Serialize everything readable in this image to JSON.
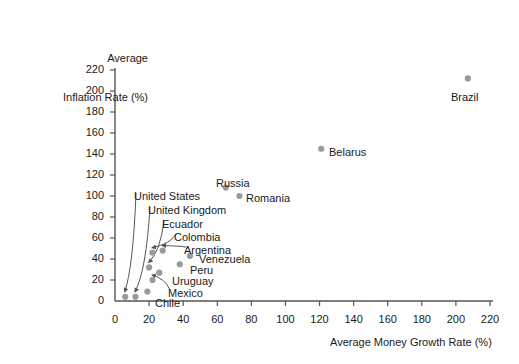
{
  "chart_data": {
    "type": "scatter",
    "title": "",
    "xlabel": "Average Money Growth Rate (%)",
    "ylabel_line1": "Average",
    "ylabel_line2": "Inflation Rate (%)",
    "xlim": [
      0,
      220
    ],
    "ylim": [
      0,
      220
    ],
    "xticks": [
      0,
      20,
      40,
      60,
      80,
      100,
      120,
      140,
      160,
      180,
      200,
      220
    ],
    "yticks": [
      0,
      20,
      40,
      60,
      80,
      100,
      120,
      140,
      160,
      180,
      200,
      220
    ],
    "grid": false,
    "legend": "none",
    "point_color": "#9a9a9a",
    "axis_color": "#555555",
    "text_color": "#1a1a1a",
    "points": [
      {
        "name": "Brazil",
        "x": 207,
        "y": 212,
        "label_dx": -2,
        "label_dy": 11,
        "label_anchor": "middle",
        "leader": false
      },
      {
        "name": "Belarus",
        "x": 121,
        "y": 145,
        "label_dx": 6,
        "label_dy": 4,
        "label_anchor": "start",
        "leader": false
      },
      {
        "name": "Russia",
        "x": 65,
        "y": 108,
        "label_dx": -3,
        "label_dy": -7,
        "label_anchor": "middle",
        "leader": false
      },
      {
        "name": "Romania",
        "x": 73,
        "y": 100,
        "label_dx": 6,
        "label_dy": 4,
        "label_anchor": "start",
        "leader": false
      },
      {
        "name": "Venezuela",
        "x": 44,
        "y": 43,
        "label_dx": 6,
        "label_dy": 4,
        "label_anchor": "start",
        "leader": false
      },
      {
        "name": "Peru",
        "x": 38,
        "y": 35,
        "label_dx": 6,
        "label_dy": 4,
        "label_anchor": "start",
        "leader": false
      },
      {
        "name": "Argentina",
        "x": 28,
        "y": 48,
        "label_dx": 0,
        "label_dy": 0,
        "label_anchor": "start",
        "leader": true
      },
      {
        "name": "Colombia",
        "x": 22,
        "y": 46,
        "label_dx": 0,
        "label_dy": 0,
        "label_anchor": "start",
        "leader": true
      },
      {
        "name": "Ecuador",
        "x": 20,
        "y": 32,
        "label_dx": 0,
        "label_dy": 0,
        "label_anchor": "start",
        "leader": true
      },
      {
        "name": "Uruguay",
        "x": 26,
        "y": 27,
        "label_dx": 6,
        "label_dy": 4,
        "label_anchor": "start",
        "leader": false
      },
      {
        "name": "Mexico",
        "x": 22,
        "y": 20,
        "label_dx": 0,
        "label_dy": 0,
        "label_anchor": "start",
        "leader": true
      },
      {
        "name": "Chile",
        "x": 19,
        "y": 9,
        "label_dx": 6,
        "label_dy": 4,
        "label_anchor": "start",
        "leader": false
      },
      {
        "name": "United Kingdom",
        "x": 12,
        "y": 4,
        "label_dx": 0,
        "label_dy": 0,
        "label_anchor": "start",
        "leader": true
      },
      {
        "name": "United States",
        "x": 6,
        "y": 4,
        "label_dx": 0,
        "label_dy": 0,
        "label_anchor": "start",
        "leader": true
      }
    ],
    "label_blocks": [
      {
        "name": "United States",
        "lx": 134,
        "ly": 190
      },
      {
        "name": "United Kingdom",
        "lx": 148,
        "ly": 204
      },
      {
        "name": "Ecuador",
        "lx": 162,
        "ly": 218
      },
      {
        "name": "Colombia",
        "lx": 174,
        "ly": 231
      },
      {
        "name": "Argentina",
        "lx": 184,
        "ly": 244
      },
      {
        "name": "Venezuela",
        "lx": 199,
        "ly": 253
      },
      {
        "name": "Peru",
        "lx": 190,
        "ly": 264
      },
      {
        "name": "Uruguay",
        "lx": 172,
        "ly": 275
      },
      {
        "name": "Mexico",
        "lx": 168,
        "ly": 287
      },
      {
        "name": "Chile",
        "lx": 155,
        "ly": 297
      },
      {
        "name": "Russia",
        "lx": 216,
        "ly": 177
      },
      {
        "name": "Romania",
        "lx": 246,
        "ly": 192
      },
      {
        "name": "Belarus",
        "lx": 329,
        "ly": 146
      },
      {
        "name": "Brazil",
        "lx": 451,
        "ly": 91
      }
    ]
  }
}
